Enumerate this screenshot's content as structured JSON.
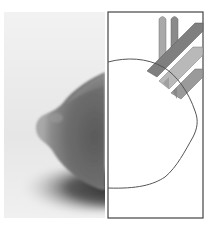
{
  "figure": {
    "panels": [
      {
        "id": "photo",
        "subject": "lemon-photograph"
      },
      {
        "id": "diagram",
        "subject": "lemon-outline-with-bands"
      }
    ],
    "colors": {
      "background": "#ffffff",
      "photo_background": "#ececec",
      "lemon_dark": "#4a4a4a",
      "lemon_mid": "#7a7a7a",
      "shadow": "#3c3c3c",
      "frame_stroke": "#444444",
      "band_dark": "#7f7f7f",
      "band_mid": "#9a9a9a",
      "band_light": "#b9b9b9",
      "rod_light": "#a9a9a9",
      "rod_dark": "#8a8a8a"
    }
  }
}
